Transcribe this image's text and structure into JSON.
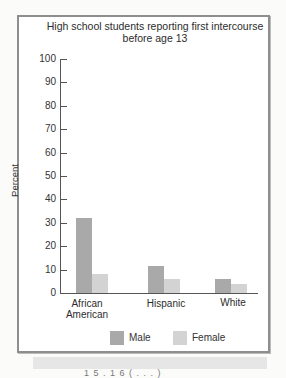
{
  "chart_data": {
    "type": "bar",
    "title": "High school students reporting first intercourse before age 13",
    "title_lines": [
      "High school students reporting first intercourse",
      "before age 13"
    ],
    "xlabel": "",
    "ylabel": "Percent",
    "ylim": [
      0,
      100
    ],
    "yticks": [
      0,
      10,
      20,
      30,
      40,
      50,
      60,
      70,
      80,
      90,
      100
    ],
    "categories": [
      "African American",
      "Hispanic",
      "White"
    ],
    "category_lines": [
      [
        "African",
        "American"
      ],
      [
        "Hispanic"
      ],
      [
        "White"
      ]
    ],
    "series": [
      {
        "name": "Male",
        "color": "#a9a9a9",
        "values": [
          32,
          11.5,
          6
        ]
      },
      {
        "name": "Female",
        "color": "#d3d3d3",
        "values": [
          8,
          6,
          4
        ]
      }
    ],
    "grid": false,
    "legend_position": "bottom"
  },
  "legend": {
    "male": "Male",
    "female": "Female"
  },
  "caption_partial": "1 5 . 1 6   ( . . . )"
}
